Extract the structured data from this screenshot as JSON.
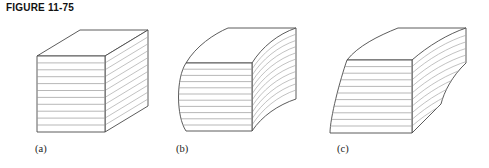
{
  "figure": {
    "caption": "FIGURE 11-75",
    "panels": [
      {
        "id": "a",
        "label": "(a)",
        "shape_name": "straight-laminated-block"
      },
      {
        "id": "b",
        "label": "(b)",
        "shape_name": "curved-laminated-block"
      },
      {
        "id": "c",
        "label": "(c)",
        "shape_name": "tapered-curved-laminated-block"
      }
    ]
  },
  "colors": {
    "background": "#ffffff",
    "outline": "#4a4a4a",
    "layer_line": "#9a9a9a",
    "hatch_line": "#a8a8a8",
    "caption_text": "#111111",
    "label_text": "#1a1a1a",
    "face_fill": "#ffffff"
  },
  "geometry": {
    "panel_a": {
      "front_top_left": [
        37,
        56
      ],
      "front_top_right": [
        105,
        56
      ],
      "front_bottom_left": [
        37,
        132
      ],
      "front_bottom_right": [
        105,
        132
      ],
      "back_top_left": [
        80,
        30
      ],
      "back_top_right": [
        148,
        30
      ],
      "back_bottom_right": [
        148,
        106
      ],
      "layer_count": 11
    },
    "panel_b": {
      "front_top_left": [
        186,
        63
      ],
      "front_top_right": [
        252,
        63
      ],
      "front_bottom_left": [
        186,
        131
      ],
      "front_bottom_right": [
        252,
        131
      ],
      "back_top_right": [
        296,
        28
      ],
      "back_bottom_right": [
        296,
        99
      ],
      "layer_count": 11
    },
    "panel_c": {
      "front_top_left": [
        347,
        60
      ],
      "front_top_right": [
        412,
        60
      ],
      "front_bottom_left": [
        330,
        133
      ],
      "front_bottom_right": [
        412,
        133
      ],
      "back_top_right": [
        466,
        28
      ],
      "back_bottom_right": [
        460,
        104
      ],
      "layer_count": 11
    }
  }
}
